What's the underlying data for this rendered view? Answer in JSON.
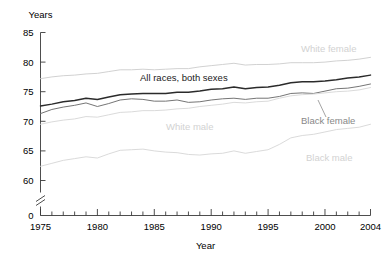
{
  "chart_data": {
    "type": "line",
    "title": "",
    "xlabel": "Year",
    "ylabel": "Years",
    "xlim": [
      1975,
      2004
    ],
    "ylim": [
      60,
      85
    ],
    "y_axis_break": true,
    "y_zero_shown": true,
    "grid": false,
    "legend_position": "inline-annotations",
    "yticks": [
      85,
      80,
      75,
      70,
      65,
      60,
      0
    ],
    "ytick_labels": [
      "85",
      "80",
      "75",
      "70",
      "65",
      "60",
      "0"
    ],
    "xticks": [
      1975,
      1980,
      1985,
      1990,
      1995,
      2000,
      2004
    ],
    "xtick_labels": [
      "1975",
      "1980",
      "1985",
      "1990",
      "1995",
      "2000",
      "2004"
    ],
    "minor_xtick_step": 1,
    "x": [
      1975,
      1976,
      1977,
      1978,
      1979,
      1980,
      1981,
      1982,
      1983,
      1984,
      1985,
      1986,
      1987,
      1988,
      1989,
      1990,
      1991,
      1992,
      1993,
      1994,
      1995,
      1996,
      1997,
      1998,
      1999,
      2000,
      2001,
      2002,
      2003,
      2004
    ],
    "series": [
      {
        "name": "White female",
        "label": "White female",
        "color": "#cfcfcf",
        "label_color": "#d2d2d2",
        "values": [
          77.2,
          77.5,
          77.7,
          77.8,
          78.0,
          78.1,
          78.4,
          78.7,
          78.7,
          78.8,
          78.7,
          78.8,
          78.9,
          78.9,
          79.2,
          79.4,
          79.6,
          79.8,
          79.5,
          79.6,
          79.6,
          79.7,
          79.9,
          79.9,
          79.9,
          80.0,
          80.2,
          80.3,
          80.5,
          80.8
        ],
        "dash": false
      },
      {
        "name": "All races, both sexes",
        "label": "All races, both sexes",
        "color": "#2b2b2b",
        "label_color": "#1a1a1a",
        "values": [
          72.6,
          72.9,
          73.3,
          73.5,
          73.9,
          73.7,
          74.1,
          74.5,
          74.6,
          74.7,
          74.7,
          74.7,
          74.9,
          74.9,
          75.1,
          75.4,
          75.5,
          75.8,
          75.5,
          75.7,
          75.8,
          76.1,
          76.5,
          76.7,
          76.7,
          76.8,
          77.0,
          77.3,
          77.5,
          77.8
        ],
        "dash": false
      },
      {
        "name": "Black female",
        "label": "Black female",
        "color": "#6e6e6e",
        "label_color": "#555555",
        "values": [
          71.3,
          72.0,
          72.4,
          72.7,
          73.1,
          72.5,
          73.0,
          73.6,
          73.8,
          73.7,
          73.4,
          73.4,
          73.6,
          73.2,
          73.3,
          73.6,
          73.8,
          73.9,
          73.7,
          73.9,
          73.9,
          74.2,
          74.7,
          74.8,
          74.7,
          75.1,
          75.5,
          75.6,
          75.9,
          76.3
        ],
        "dash": false
      },
      {
        "name": "White male",
        "label": "White male",
        "color": "#d8d8d8",
        "label_color": "#d2d2d2",
        "values": [
          69.5,
          69.9,
          70.2,
          70.4,
          70.8,
          70.7,
          71.1,
          71.5,
          71.6,
          71.8,
          71.8,
          71.9,
          72.1,
          72.2,
          72.5,
          72.7,
          72.9,
          73.2,
          73.1,
          73.3,
          73.4,
          73.9,
          74.3,
          74.5,
          74.6,
          74.8,
          75.0,
          75.1,
          75.3,
          75.7
        ],
        "dash": false
      },
      {
        "name": "Black male",
        "label": "Black male",
        "color": "#d8d8d8",
        "label_color": "#d2d2d2",
        "values": [
          62.4,
          62.9,
          63.4,
          63.7,
          64.0,
          63.8,
          64.5,
          65.1,
          65.2,
          65.3,
          65.0,
          64.8,
          64.7,
          64.4,
          64.3,
          64.5,
          64.6,
          65.0,
          64.6,
          64.9,
          65.2,
          66.1,
          67.2,
          67.6,
          67.8,
          68.2,
          68.6,
          68.8,
          69.0,
          69.5
        ],
        "dash": false
      }
    ],
    "annotations": [
      {
        "text": "All races, both sexes",
        "x": 140,
        "y": 81,
        "anchor": "start",
        "tone": "dark",
        "leader": null
      },
      {
        "text": "White female",
        "x": 301,
        "y": 52,
        "anchor": "start",
        "tone": "light",
        "leader": null
      },
      {
        "text": "Black female",
        "x": 301,
        "y": 124,
        "anchor": "start",
        "tone": "mid",
        "leader": {
          "x1": 326,
          "y1": 117,
          "x2": 318,
          "y2": 100
        }
      },
      {
        "text": "White male",
        "x": 166,
        "y": 130,
        "anchor": "start",
        "tone": "light",
        "leader": null
      },
      {
        "text": "Black male",
        "x": 306,
        "y": 161,
        "anchor": "start",
        "tone": "light",
        "leader": null
      }
    ]
  },
  "axis": {
    "y_label": "Years",
    "x_label": "Year"
  }
}
